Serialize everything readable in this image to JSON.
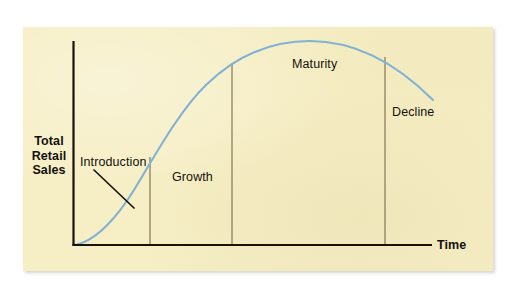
{
  "figure": {
    "name": "product-life-cycle-curve",
    "background_color": "#f6eec4",
    "page_color": "#ffffff",
    "curve_color": "#7fb2d4",
    "axis_color": "#1a1208",
    "divider_color": "#6b6040",
    "text_color": "#14110c"
  },
  "axes": {
    "y_label": "Total\nRetail\nSales",
    "x_label": "Time",
    "origin": {
      "x": 73,
      "y": 245
    },
    "y_top": 41,
    "x_right": 432
  },
  "stages": [
    {
      "label": "Introduction",
      "x": 80,
      "y": 155
    },
    {
      "label": "Growth",
      "x": 172,
      "y": 170
    },
    {
      "label": "Maturity",
      "x": 292,
      "y": 57
    },
    {
      "label": "Decline",
      "x": 392,
      "y": 105
    }
  ],
  "dividers": [
    {
      "name": "introduction-growth-divider",
      "x": 150,
      "top": 157,
      "bottom": 245
    },
    {
      "name": "growth-maturity-divider",
      "x": 232,
      "top": 63,
      "bottom": 245
    },
    {
      "name": "maturity-decline-divider",
      "x": 385,
      "top": 57,
      "bottom": 245
    }
  ],
  "leader_line": {
    "name": "introduction-leader-line",
    "from": {
      "x": 94,
      "y": 170
    },
    "to": {
      "x": 134,
      "y": 208
    }
  },
  "chart_data": {
    "type": "line",
    "title": "",
    "subtitle": "",
    "xlabel": "Time",
    "ylabel": "Total Retail Sales",
    "xlim": [
      0,
      100
    ],
    "ylim": [
      0,
      100
    ],
    "grid": false,
    "legend": null,
    "annotations": [
      "Introduction",
      "Growth",
      "Maturity",
      "Decline"
    ],
    "stage_boundaries_pct": [
      0,
      19,
      41,
      86,
      100
    ],
    "series": [
      {
        "name": "Total Retail Sales",
        "color": "#7fb2d4",
        "x": [
          0,
          5,
          10,
          15,
          19,
          25,
          30,
          35,
          41,
          50,
          58,
          66,
          72,
          78,
          86,
          92,
          96,
          100
        ],
        "y": [
          0,
          3,
          9,
          20,
          31,
          48,
          62,
          74,
          84,
          93,
          98,
          100,
          100,
          98,
          90,
          81,
          75,
          71
        ]
      }
    ]
  }
}
